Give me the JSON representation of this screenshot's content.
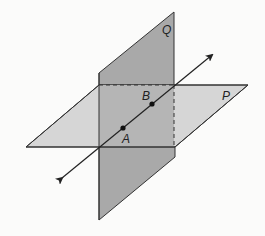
{
  "diagram": {
    "colors": {
      "background": "#fbfbfa",
      "plane_p_fill": "#d6d6d6",
      "plane_q_fill": "#a9a9a9",
      "plane_q_overlap_fill": "#b8b8b8",
      "stroke": "#333333"
    },
    "planes": [
      {
        "label": "Q",
        "label_pos": [
          165,
          34
        ]
      },
      {
        "label": "P",
        "label_pos": [
          224,
          100
        ]
      }
    ],
    "points": [
      {
        "label": "A",
        "pos": [
          123,
          128
        ],
        "label_pos": [
          124,
          142
        ]
      },
      {
        "label": "B",
        "pos": [
          152,
          104
        ],
        "label_pos": [
          143,
          100
        ]
      }
    ],
    "line": {
      "from": [
        62,
        178
      ],
      "to": [
        212,
        55
      ],
      "arrows": "both"
    }
  }
}
